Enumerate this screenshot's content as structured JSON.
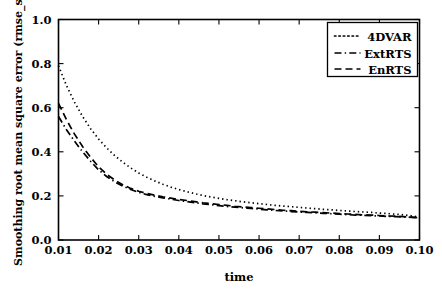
{
  "chart_data": {
    "type": "line",
    "title": "",
    "xlabel": "time",
    "ylabel": "Smoothing root mean square error (rmse_s)",
    "xlim": [
      0.01,
      0.1
    ],
    "ylim": [
      0.0,
      1.0
    ],
    "grid": false,
    "legend_position": "upper right",
    "xticks": [
      "0.01",
      "0.02",
      "0.03",
      "0.04",
      "0.05",
      "0.06",
      "0.07",
      "0.08",
      "0.09",
      "0.10"
    ],
    "xtick_values": [
      0.01,
      0.02,
      0.03,
      0.04,
      0.05,
      0.06,
      0.07,
      0.08,
      0.09,
      0.1
    ],
    "yticks": [
      "0.0",
      "0.2",
      "0.4",
      "0.6",
      "0.8",
      "1.0"
    ],
    "ytick_values": [
      0.0,
      0.2,
      0.4,
      0.6,
      0.8,
      1.0
    ],
    "x": [
      0.01,
      0.012,
      0.014,
      0.016,
      0.018,
      0.02,
      0.022,
      0.024,
      0.026,
      0.028,
      0.03,
      0.032,
      0.034,
      0.036,
      0.038,
      0.04,
      0.042,
      0.044,
      0.046,
      0.048,
      0.05,
      0.052,
      0.054,
      0.056,
      0.058,
      0.06,
      0.062,
      0.064,
      0.066,
      0.068,
      0.07,
      0.072,
      0.074,
      0.076,
      0.078,
      0.08,
      0.082,
      0.084,
      0.086,
      0.088,
      0.09,
      0.092,
      0.094,
      0.096,
      0.098,
      0.1
    ],
    "series": [
      {
        "name": "4DVAR",
        "linestyle": "dotted",
        "color": "#000000",
        "values": [
          0.79,
          0.7,
          0.625,
          0.56,
          0.505,
          0.458,
          0.418,
          0.383,
          0.353,
          0.327,
          0.304,
          0.285,
          0.268,
          0.253,
          0.24,
          0.229,
          0.219,
          0.21,
          0.202,
          0.195,
          0.189,
          0.183,
          0.178,
          0.173,
          0.169,
          0.165,
          0.161,
          0.157,
          0.154,
          0.151,
          0.148,
          0.145,
          0.142,
          0.139,
          0.137,
          0.134,
          0.132,
          0.129,
          0.127,
          0.125,
          0.122,
          0.12,
          0.117,
          0.114,
          0.11,
          0.103
        ]
      },
      {
        "name": "ExtRTS",
        "linestyle": "dashdot",
        "color": "#000000",
        "values": [
          0.56,
          0.5,
          0.448,
          0.4,
          0.357,
          0.318,
          0.288,
          0.264,
          0.245,
          0.229,
          0.216,
          0.206,
          0.198,
          0.191,
          0.185,
          0.179,
          0.174,
          0.169,
          0.164,
          0.16,
          0.156,
          0.152,
          0.149,
          0.146,
          0.143,
          0.14,
          0.137,
          0.134,
          0.132,
          0.129,
          0.127,
          0.125,
          0.123,
          0.121,
          0.119,
          0.117,
          0.115,
          0.113,
          0.112,
          0.11,
          0.109,
          0.107,
          0.106,
          0.105,
          0.103,
          0.1
        ]
      },
      {
        "name": "EnRTS",
        "linestyle": "dashed",
        "color": "#000000",
        "values": [
          0.62,
          0.545,
          0.48,
          0.424,
          0.375,
          0.332,
          0.298,
          0.272,
          0.251,
          0.234,
          0.221,
          0.211,
          0.203,
          0.196,
          0.19,
          0.184,
          0.179,
          0.174,
          0.169,
          0.165,
          0.161,
          0.157,
          0.153,
          0.15,
          0.147,
          0.144,
          0.141,
          0.138,
          0.135,
          0.133,
          0.13,
          0.128,
          0.126,
          0.124,
          0.122,
          0.12,
          0.118,
          0.116,
          0.114,
          0.113,
          0.111,
          0.109,
          0.108,
          0.106,
          0.104,
          0.101
        ]
      }
    ]
  },
  "legend": {
    "entries": [
      {
        "label": "4DVAR"
      },
      {
        "label": "ExtRTS"
      },
      {
        "label": "EnRTS"
      }
    ]
  },
  "axes": {
    "x_title": "time",
    "y_title": "Smoothing root mean square error (rmse_s)"
  }
}
